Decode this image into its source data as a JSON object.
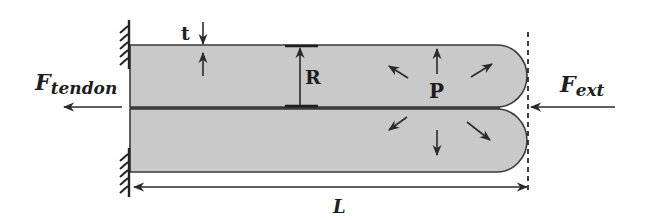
{
  "diagram": {
    "type": "soft-actuator-beam-schematic",
    "labels": {
      "thickness": "t",
      "radius": "R",
      "pressure": "P",
      "length": "L",
      "f_tendon_main": "F",
      "f_tendon_sub": "tendon",
      "f_ext_main": "F",
      "f_ext_sub": "ext"
    },
    "colors": {
      "body_fill": "#c9c9c9",
      "stroke": "#2a2a2a",
      "background": "#ffffff"
    },
    "components": [
      "fixed-wall-top",
      "fixed-wall-bottom",
      "upper-chamber",
      "lower-chamber",
      "thickness-indicator",
      "radius-dimension",
      "pressure-arrows",
      "tendon-force-arrow",
      "external-force-arrow",
      "boundary-dashed-line",
      "length-dimension"
    ]
  }
}
